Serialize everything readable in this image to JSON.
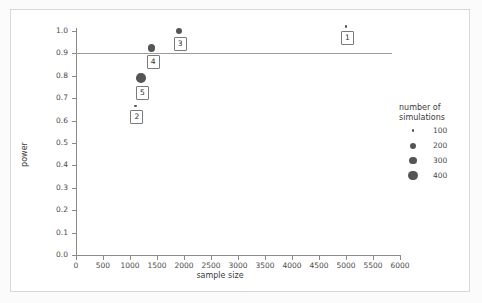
{
  "chart_data": {
    "type": "scatter",
    "title": "",
    "xlabel": "sample size",
    "ylabel": "power",
    "xlim": [
      0,
      6000
    ],
    "ylim": [
      0.0,
      1.0
    ],
    "xticks": [
      0,
      500,
      1000,
      1500,
      2000,
      2500,
      3000,
      3500,
      4000,
      4500,
      5000,
      5500,
      6000
    ],
    "yticks": [
      "0.0",
      "0.1",
      "0.2",
      "0.3",
      "0.4",
      "0.5",
      "0.6",
      "0.7",
      "0.8",
      "0.9",
      "1.0"
    ],
    "grid": false,
    "reference_line": {
      "orientation": "horizontal",
      "y": 0.9
    },
    "points": [
      {
        "label": "1",
        "x": 5000,
        "y": 1.02,
        "size": 100
      },
      {
        "label": "2",
        "x": 1100,
        "y": 0.665,
        "size": 100
      },
      {
        "label": "3",
        "x": 1900,
        "y": 1.0,
        "size": 200
      },
      {
        "label": "4",
        "x": 1400,
        "y": 0.925,
        "size": 300
      },
      {
        "label": "5",
        "x": 1200,
        "y": 0.79,
        "size": 400
      }
    ],
    "legend": {
      "position": "right",
      "title_line1": "number of",
      "title_line2": "simulations",
      "entries": [
        {
          "label": "100",
          "size": 100
        },
        {
          "label": "200",
          "size": 200
        },
        {
          "label": "300",
          "size": 300
        },
        {
          "label": "400",
          "size": 400
        }
      ]
    },
    "colors": {
      "marker": "#555555",
      "axis": "#8a8a8a",
      "reference_line": "#9b9b9b",
      "text": "#3a3a3a"
    }
  }
}
